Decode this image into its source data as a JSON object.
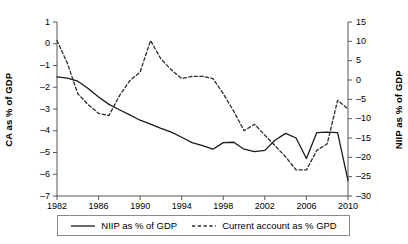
{
  "chart_data": {
    "type": "line",
    "title": "",
    "xlabel": "",
    "ylabel": "CA as % of GDP",
    "y2label": "NIIP as % of GDP",
    "grid": false,
    "legend_position": "bottom",
    "x": [
      1982,
      1983,
      1984,
      1985,
      1986,
      1987,
      1988,
      1989,
      1990,
      1991,
      1992,
      1993,
      1994,
      1995,
      1996,
      1997,
      1998,
      1999,
      2000,
      2001,
      2002,
      2003,
      2004,
      2005,
      2006,
      2007,
      2008,
      2009,
      2010
    ],
    "xlim": [
      1982,
      2010
    ],
    "xticks": [
      "1982",
      "1986",
      "1990",
      "1994",
      "1998",
      "2002",
      "2006",
      "2010"
    ],
    "xtick_values": [
      1982,
      1986,
      1990,
      1994,
      1998,
      2002,
      2006,
      2010
    ],
    "ylim": [
      -7,
      1
    ],
    "yticks": [
      "1",
      "0",
      "-1",
      "-2",
      "-3",
      "-4",
      "-5",
      "-6",
      "-7"
    ],
    "ytick_values": [
      1,
      0,
      -1,
      -2,
      -3,
      -4,
      -5,
      -6,
      -7
    ],
    "y2lim": [
      -30,
      15
    ],
    "y2ticks": [
      "15",
      "10",
      "5",
      "0",
      "-5",
      "-10",
      "-15",
      "-20",
      "-25",
      "-30"
    ],
    "y2tick_values": [
      15,
      10,
      5,
      0,
      -5,
      -10,
      -15,
      -20,
      -25,
      -30
    ],
    "series": [
      {
        "name": "NIIP as % of GDP",
        "axis": "right",
        "style": "solid",
        "color": "#1a1a1a",
        "values": [
          0.8,
          0.5,
          -0.3,
          -2.2,
          -4.4,
          -6.3,
          -7.7,
          -9.0,
          -10.4,
          -11.4,
          -12.5,
          -13.5,
          -14.8,
          -16.2,
          -17.0,
          -17.9,
          -16.2,
          -16.1,
          -17.9,
          -18.5,
          -18.2,
          -15.5,
          -13.8,
          -15.0,
          -20.3,
          -13.6,
          -13.5,
          -13.6,
          -26.0
        ]
      },
      {
        "name": "Current account as % GPD",
        "axis": "left",
        "style": "dashed",
        "color": "#2a2a2a",
        "values": [
          0.15,
          -0.9,
          -2.3,
          -2.8,
          -3.2,
          -3.3,
          -2.4,
          -1.7,
          -1.3,
          0.15,
          -0.7,
          -1.2,
          -1.6,
          -1.5,
          -1.5,
          -1.6,
          -2.3,
          -3.1,
          -4.0,
          -3.7,
          -4.2,
          -4.7,
          -5.2,
          -5.8,
          -5.8,
          -4.9,
          -4.6,
          -2.6,
          -3.0
        ]
      }
    ]
  },
  "legend": {
    "entries": [
      {
        "label": "NIIP as % of GDP",
        "style": "solid"
      },
      {
        "label": "Current account as % GPD",
        "style": "dashed"
      }
    ]
  }
}
